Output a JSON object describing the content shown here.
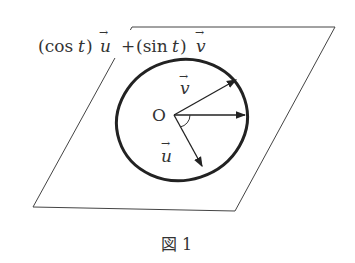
{
  "figure": {
    "caption": "図 1",
    "formula_label": {
      "cos_part": "(cos",
      "t1": "t",
      "close1": ")",
      "u": "u",
      "plus": "+",
      "sin_part": "(sin",
      "t2": "t",
      "close2": ")",
      "v": "v"
    },
    "origin_label": "O",
    "vector_v_label": "v",
    "vector_u_label": "u",
    "arrow_glyph": "→"
  }
}
